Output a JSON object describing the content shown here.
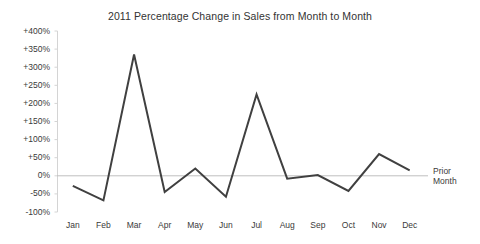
{
  "chart_data": {
    "type": "line",
    "title": "2011 Percentage Change in Sales from Month to Month",
    "xlabel": "",
    "ylabel": "",
    "categories": [
      "Jan",
      "Feb",
      "Mar",
      "Apr",
      "May",
      "Jun",
      "Jul",
      "Aug",
      "Sep",
      "Oct",
      "Nov",
      "Dec"
    ],
    "values": [
      -28,
      -68,
      335,
      -45,
      20,
      -58,
      225,
      -8,
      2,
      -42,
      60,
      15
    ],
    "series": [
      {
        "name": "Percentage Change in Sales",
        "values": [
          -28,
          -68,
          335,
          -45,
          20,
          -58,
          225,
          -8,
          2,
          -42,
          60,
          15
        ]
      }
    ],
    "ylim": [
      -100,
      400
    ],
    "ytick_values": [
      400,
      350,
      300,
      250,
      200,
      150,
      100,
      50,
      0,
      -50,
      -100
    ],
    "ytick_labels": [
      "+400%",
      "+350%",
      "+300%",
      "+250%",
      "+200%",
      "+150%",
      "+100%",
      "+50%",
      "0%",
      "-50%",
      "-100%"
    ],
    "grid": false,
    "legend_position": "none",
    "annotations": [
      {
        "name": "baseline-label",
        "line1": "Prior",
        "line2": "Month",
        "value": 0
      }
    ],
    "colors": {
      "line": "#404040",
      "baseline": "#bfbfbf",
      "axis": "#d4d4d4",
      "text": "#3a3a3a",
      "background": "#ffffff"
    }
  }
}
